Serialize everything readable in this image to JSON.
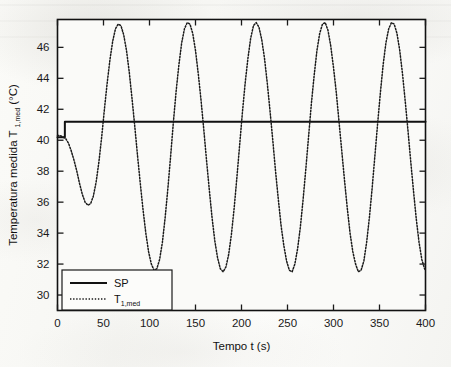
{
  "figure": {
    "background_color": "#f7f7f4",
    "frame_color": "#1a1a1a",
    "media": "scanned-document"
  },
  "chart_data": {
    "type": "line",
    "title": "",
    "xlabel": "Tempo t (s)",
    "ylabel_main": "Temperatura medida T",
    "ylabel_sub": "1,med",
    "ylabel_unit": "(°C)",
    "ylabel_full": "Temperatura medida T1,med (°C)",
    "xlim": [
      0,
      400
    ],
    "ylim": [
      29.0,
      47.8
    ],
    "xticks": [
      0,
      50,
      100,
      150,
      200,
      250,
      300,
      350,
      400
    ],
    "xticklabels": [
      "0",
      "50",
      "100",
      "150",
      "200",
      "250",
      "300",
      "350",
      "400"
    ],
    "yticks": [
      30,
      32,
      34,
      36,
      38,
      40,
      42,
      44,
      46
    ],
    "yticklabels": [
      "30",
      "32",
      "34",
      "36",
      "38",
      "40",
      "42",
      "44",
      "46"
    ],
    "grid": false,
    "legend_position": "lower left",
    "series": [
      {
        "name": "SP",
        "label": "SP",
        "style": "solid",
        "color": "#111111",
        "width": 2.0,
        "description": "setpoint step from 40.2 to 41.2 degC at t = 8 s",
        "points": [
          [
            0,
            40.2
          ],
          [
            8,
            40.2
          ],
          [
            8,
            41.2
          ],
          [
            400,
            41.2
          ]
        ]
      },
      {
        "name": "T1med",
        "label": "T1,med",
        "style": "dotted",
        "color": "#1a1a1a",
        "width": 1.5,
        "description": "measured temperature, sustained oscillation, period about 69 s",
        "points": [
          [
            0,
            40.3
          ],
          [
            3,
            40.3
          ],
          [
            6,
            40.2
          ],
          [
            9,
            40.1
          ],
          [
            12,
            39.8
          ],
          [
            15,
            39.3
          ],
          [
            18,
            38.7
          ],
          [
            21,
            38.0
          ],
          [
            24,
            37.2
          ],
          [
            27,
            36.5
          ],
          [
            30,
            36.0
          ],
          [
            33,
            35.8
          ],
          [
            36,
            35.9
          ],
          [
            39,
            36.4
          ],
          [
            42,
            37.3
          ],
          [
            45,
            38.6
          ],
          [
            48,
            40.2
          ],
          [
            51,
            42.0
          ],
          [
            54,
            43.7
          ],
          [
            57,
            45.2
          ],
          [
            60,
            46.4
          ],
          [
            63,
            47.2
          ],
          [
            66,
            47.5
          ],
          [
            69,
            47.4
          ],
          [
            72,
            46.8
          ],
          [
            75,
            45.8
          ],
          [
            78,
            44.4
          ],
          [
            81,
            42.7
          ],
          [
            84,
            40.9
          ],
          [
            87,
            39.0
          ],
          [
            90,
            37.2
          ],
          [
            93,
            35.5
          ],
          [
            96,
            34.0
          ],
          [
            99,
            32.8
          ],
          [
            102,
            32.0
          ],
          [
            105,
            31.6
          ],
          [
            108,
            31.7
          ],
          [
            111,
            32.3
          ],
          [
            114,
            33.4
          ],
          [
            117,
            35.0
          ],
          [
            120,
            36.9
          ],
          [
            123,
            39.0
          ],
          [
            126,
            41.2
          ],
          [
            129,
            43.2
          ],
          [
            132,
            44.9
          ],
          [
            135,
            46.3
          ],
          [
            138,
            47.2
          ],
          [
            141,
            47.6
          ],
          [
            144,
            47.5
          ],
          [
            147,
            46.9
          ],
          [
            150,
            45.8
          ],
          [
            153,
            44.3
          ],
          [
            156,
            42.6
          ],
          [
            159,
            40.7
          ],
          [
            162,
            38.7
          ],
          [
            165,
            36.8
          ],
          [
            168,
            35.0
          ],
          [
            171,
            33.5
          ],
          [
            174,
            32.4
          ],
          [
            177,
            31.7
          ],
          [
            180,
            31.5
          ],
          [
            183,
            31.8
          ],
          [
            186,
            32.6
          ],
          [
            189,
            33.9
          ],
          [
            192,
            35.6
          ],
          [
            195,
            37.6
          ],
          [
            198,
            39.7
          ],
          [
            201,
            41.8
          ],
          [
            204,
            43.7
          ],
          [
            207,
            45.3
          ],
          [
            210,
            46.6
          ],
          [
            213,
            47.4
          ],
          [
            216,
            47.6
          ],
          [
            219,
            47.3
          ],
          [
            222,
            46.5
          ],
          [
            225,
            45.3
          ],
          [
            228,
            43.7
          ],
          [
            231,
            41.9
          ],
          [
            234,
            40.0
          ],
          [
            237,
            38.0
          ],
          [
            240,
            36.2
          ],
          [
            243,
            34.5
          ],
          [
            246,
            33.2
          ],
          [
            249,
            32.2
          ],
          [
            252,
            31.6
          ],
          [
            255,
            31.5
          ],
          [
            258,
            32.0
          ],
          [
            261,
            33.0
          ],
          [
            264,
            34.4
          ],
          [
            267,
            36.2
          ],
          [
            270,
            38.2
          ],
          [
            273,
            40.3
          ],
          [
            276,
            42.4
          ],
          [
            279,
            44.2
          ],
          [
            282,
            45.8
          ],
          [
            285,
            46.9
          ],
          [
            288,
            47.5
          ],
          [
            291,
            47.6
          ],
          [
            294,
            47.1
          ],
          [
            297,
            46.1
          ],
          [
            300,
            44.7
          ],
          [
            303,
            43.1
          ],
          [
            306,
            41.2
          ],
          [
            309,
            39.3
          ],
          [
            312,
            37.4
          ],
          [
            315,
            35.6
          ],
          [
            318,
            34.0
          ],
          [
            321,
            32.8
          ],
          [
            324,
            32.0
          ],
          [
            327,
            31.5
          ],
          [
            330,
            31.6
          ],
          [
            333,
            32.2
          ],
          [
            336,
            33.4
          ],
          [
            339,
            35.0
          ],
          [
            342,
            36.9
          ],
          [
            345,
            39.0
          ],
          [
            348,
            41.1
          ],
          [
            351,
            43.1
          ],
          [
            354,
            44.9
          ],
          [
            357,
            46.3
          ],
          [
            360,
            47.2
          ],
          [
            363,
            47.6
          ],
          [
            366,
            47.5
          ],
          [
            369,
            46.9
          ],
          [
            372,
            45.8
          ],
          [
            375,
            44.3
          ],
          [
            378,
            42.5
          ],
          [
            381,
            40.6
          ],
          [
            384,
            38.6
          ],
          [
            387,
            36.7
          ],
          [
            390,
            34.9
          ],
          [
            393,
            33.4
          ],
          [
            396,
            32.3
          ],
          [
            399,
            31.7
          ],
          [
            400,
            31.6
          ]
        ]
      }
    ],
    "annotations": {
      "peak_value": 47.6,
      "trough_value": 31.5,
      "first_trough_value": 35.8,
      "setpoint_initial": 40.2,
      "setpoint_final": 41.2,
      "step_time": 8,
      "oscillation_period": 69,
      "peak_count": 6
    }
  }
}
